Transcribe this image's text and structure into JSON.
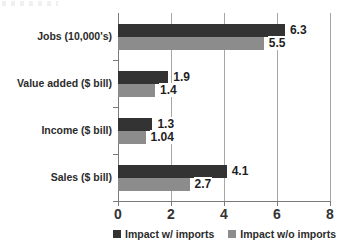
{
  "chart_data": {
    "type": "bar",
    "orientation": "horizontal",
    "title": "",
    "subtitle": "",
    "xlabel": "",
    "ylabel": "",
    "xlim": [
      0,
      8
    ],
    "xticks": [
      "0",
      "2",
      "4",
      "6",
      "8"
    ],
    "xtick_values": [
      0,
      2,
      4,
      6,
      8
    ],
    "grid": true,
    "grid_axis": "x",
    "legend_position": "bottom",
    "categories": [
      "Jobs (10,000's)",
      "Value added ($ bill)",
      "Income ($ bill)",
      "Sales ($ bill)"
    ],
    "series": [
      {
        "name": "Impact w/ imports",
        "color": "#333333",
        "values": [
          6.3,
          1.9,
          1.3,
          4.1
        ],
        "labels": [
          "6.3",
          "1.9",
          "1.3",
          "4.1"
        ]
      },
      {
        "name": "Impact w/o imports",
        "color": "#8c8c8c",
        "values": [
          5.5,
          1.4,
          1.04,
          2.7
        ],
        "labels": [
          "5.5",
          "1.4",
          "1.04",
          "2.7"
        ]
      }
    ]
  },
  "legend": {
    "items": [
      {
        "label": "Impact w/ imports",
        "color": "#333333"
      },
      {
        "label": "Impact w/o imports",
        "color": "#8c8c8c"
      }
    ]
  },
  "colors": {
    "series_dark": "#333333",
    "series_gray": "#8c8c8c",
    "axis": "#7a7a7a",
    "gridline": "#a6a6a6",
    "background": "#ffffff",
    "text": "#2b2b2b"
  }
}
